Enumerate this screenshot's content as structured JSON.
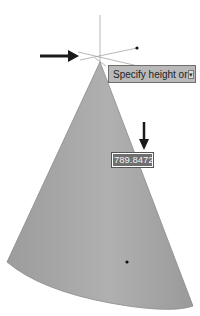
{
  "tooltip": {
    "prompt": "Specify height or",
    "options_button": "▾"
  },
  "dynamic_input": {
    "value": "789.8472"
  },
  "colors": {
    "cone_fill": "#a9a9a9",
    "tooltip_bg": "#b9b9b9",
    "arrow": "#1a1a1a",
    "crosshair": "#9a9a9a"
  },
  "annotations": {
    "arrow_left": "pointer-arrow-right",
    "arrow_down": "pointer-arrow-down"
  }
}
